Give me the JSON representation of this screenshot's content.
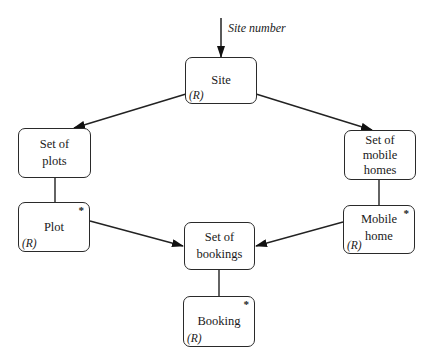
{
  "input": {
    "label": "Site number"
  },
  "nodes": {
    "site": {
      "label": "Site",
      "marker": "(R)",
      "repeat": ""
    },
    "set_of_plots": {
      "label": "Set of\nplots",
      "marker": "",
      "repeat": ""
    },
    "plot": {
      "label": "Plot",
      "marker": "(R)",
      "repeat": "*"
    },
    "set_of_mobile_homes": {
      "label": "Set of\nmobile\nhomes",
      "marker": "",
      "repeat": ""
    },
    "mobile_home": {
      "label": "Mobile\nhome",
      "marker": "(R)",
      "repeat": "*"
    },
    "set_of_bookings": {
      "label": "Set of\nbookings",
      "marker": "",
      "repeat": ""
    },
    "booking": {
      "label": "Booking",
      "marker": "(R)",
      "repeat": "*"
    }
  },
  "edges": [
    {
      "from": "input",
      "to": "site",
      "type": "arrow"
    },
    {
      "from": "site",
      "to": "set_of_plots",
      "type": "arrow"
    },
    {
      "from": "site",
      "to": "set_of_mobile_homes",
      "type": "arrow"
    },
    {
      "from": "set_of_plots",
      "to": "plot",
      "type": "line"
    },
    {
      "from": "set_of_mobile_homes",
      "to": "mobile_home",
      "type": "line"
    },
    {
      "from": "plot",
      "to": "set_of_bookings",
      "type": "arrow"
    },
    {
      "from": "mobile_home",
      "to": "set_of_bookings",
      "type": "arrow"
    },
    {
      "from": "set_of_bookings",
      "to": "booking",
      "type": "line"
    }
  ]
}
